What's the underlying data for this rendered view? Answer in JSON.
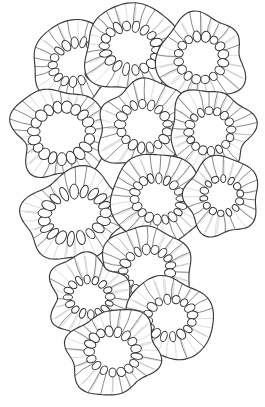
{
  "figure": {
    "description": "Monochrome scientific line illustration of a cluster of overlapping radially symmetric cellular units, each with an irregular rounded outer wall, radiating spoke-like septa and a ring of bead-shaped cells enclosing a clear central lumen.",
    "style": "pen-and-ink line drawing",
    "canvas": {
      "width": 265,
      "height": 407
    },
    "colors": {
      "background": "#fefefe",
      "outline": "#3b3b3b",
      "spoke": "#6a6a6a",
      "spoke_light": "#9a9a9a",
      "bead_outline": "#2f2f2f",
      "lumen_fill": "#ffffff",
      "body_fill": "#ffffff"
    },
    "stroke": {
      "outline_width": 1.15,
      "spoke_width": 0.75,
      "bead_width": 0.95
    },
    "unit_count": 13,
    "units": [
      {
        "id": "unit-top-left",
        "cx": 76,
        "cy": 62,
        "rx": 44,
        "ry": 41,
        "rot": -18,
        "lumen_rx": 17,
        "lumen_ry": 13,
        "lumen_rot": -25,
        "beads": 17,
        "spokes": 26,
        "wobble": 0.085,
        "seed": 11
      },
      {
        "id": "unit-top-center",
        "cx": 131,
        "cy": 48,
        "rx": 47,
        "ry": 44,
        "rot": 8,
        "lumen_rx": 19,
        "lumen_ry": 15,
        "lumen_rot": 12,
        "beads": 18,
        "spokes": 28,
        "wobble": 0.075,
        "seed": 23
      },
      {
        "id": "unit-top-right",
        "cx": 201,
        "cy": 58,
        "rx": 43,
        "ry": 43,
        "rot": -6,
        "lumen_rx": 16,
        "lumen_ry": 15,
        "lumen_rot": 5,
        "beads": 16,
        "spokes": 25,
        "wobble": 0.08,
        "seed": 37
      },
      {
        "id": "unit-mid-left",
        "cx": 62,
        "cy": 133,
        "rx": 48,
        "ry": 45,
        "rot": 14,
        "lumen_rx": 20,
        "lumen_ry": 18,
        "lumen_rot": -8,
        "beads": 19,
        "spokes": 30,
        "wobble": 0.07,
        "seed": 41
      },
      {
        "id": "unit-mid-center",
        "cx": 144,
        "cy": 126,
        "rx": 46,
        "ry": 44,
        "rot": -10,
        "lumen_rx": 17,
        "lumen_ry": 15,
        "lumen_rot": 18,
        "beads": 17,
        "spokes": 27,
        "wobble": 0.08,
        "seed": 53
      },
      {
        "id": "unit-mid-right",
        "cx": 210,
        "cy": 131,
        "rx": 41,
        "ry": 42,
        "rot": 20,
        "lumen_rx": 15,
        "lumen_ry": 14,
        "lumen_rot": -12,
        "beads": 16,
        "spokes": 26,
        "wobble": 0.085,
        "seed": 67
      },
      {
        "id": "unit-center-left",
        "cx": 75,
        "cy": 215,
        "rx": 50,
        "ry": 45,
        "rot": -8,
        "lumen_rx": 22,
        "lumen_ry": 16,
        "lumen_rot": -14,
        "beads": 19,
        "spokes": 30,
        "wobble": 0.075,
        "seed": 79
      },
      {
        "id": "unit-center",
        "cx": 158,
        "cy": 199,
        "rx": 48,
        "ry": 45,
        "rot": 12,
        "lumen_rx": 17,
        "lumen_ry": 14,
        "lumen_rot": 22,
        "beads": 18,
        "spokes": 28,
        "wobble": 0.08,
        "seed": 83
      },
      {
        "id": "unit-right-small",
        "cx": 222,
        "cy": 196,
        "rx": 38,
        "ry": 38,
        "rot": -14,
        "lumen_rx": 13,
        "lumen_ry": 12,
        "lumen_rot": 8,
        "beads": 14,
        "spokes": 23,
        "wobble": 0.085,
        "seed": 97
      },
      {
        "id": "unit-lower-center",
        "cx": 147,
        "cy": 270,
        "rx": 45,
        "ry": 44,
        "rot": 6,
        "lumen_rx": 17,
        "lumen_ry": 14,
        "lumen_rot": -18,
        "beads": 17,
        "spokes": 27,
        "wobble": 0.08,
        "seed": 103
      },
      {
        "id": "unit-lower-left",
        "cx": 89,
        "cy": 297,
        "rx": 41,
        "ry": 40,
        "rot": -20,
        "lumen_rx": 15,
        "lumen_ry": 12,
        "lumen_rot": 10,
        "beads": 16,
        "spokes": 25,
        "wobble": 0.085,
        "seed": 113
      },
      {
        "id": "unit-lower-right",
        "cx": 170,
        "cy": 318,
        "rx": 43,
        "ry": 41,
        "rot": 16,
        "lumen_rx": 16,
        "lumen_ry": 13,
        "lumen_rot": -6,
        "beads": 16,
        "spokes": 26,
        "wobble": 0.08,
        "seed": 127
      },
      {
        "id": "unit-bottom",
        "cx": 113,
        "cy": 352,
        "rx": 46,
        "ry": 42,
        "rot": -4,
        "lumen_rx": 17,
        "lumen_ry": 14,
        "lumen_rot": 16,
        "beads": 17,
        "spokes": 27,
        "wobble": 0.078,
        "seed": 131
      }
    ]
  }
}
